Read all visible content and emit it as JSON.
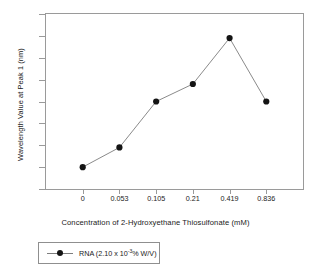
{
  "chart_data": {
    "type": "line",
    "title": "",
    "subtitle": "",
    "xlabel": "Concentration of 2-Hydroxyethane Thiosulfonate (mM)",
    "ylabel": "Wavelength Value at Peak 1 (nm)",
    "categories": [
      "0",
      "0.053",
      "0.105",
      "0.21",
      "0.419",
      "0.836"
    ],
    "values": [
      212.0,
      213.8,
      218.0,
      219.6,
      223.8,
      218.0
    ],
    "series": [
      {
        "name": "RNA (2.10 x 10-3% W/V)",
        "values": [
          212.0,
          213.8,
          218.0,
          219.6,
          223.8,
          218.0
        ]
      }
    ],
    "ylim": [
      210,
      226
    ],
    "yticks": [
      "210",
      "212",
      "214",
      "216",
      "218",
      "220",
      "222",
      "224",
      "226"
    ],
    "ytick_values": [
      210,
      212,
      214,
      216,
      218,
      220,
      222,
      224,
      226
    ],
    "grid": false,
    "legend_position": "below-left",
    "marker": "filled-circle",
    "marker_color": "#141414",
    "line_color": "#7d7d7d",
    "axis_color": "#9a9a9a",
    "background": "#ffffff"
  },
  "legend": {
    "entry_label_prefix": "RNA (2.10 x 10",
    "entry_label_exponent": "-3",
    "entry_label_suffix": "% W/V)"
  }
}
